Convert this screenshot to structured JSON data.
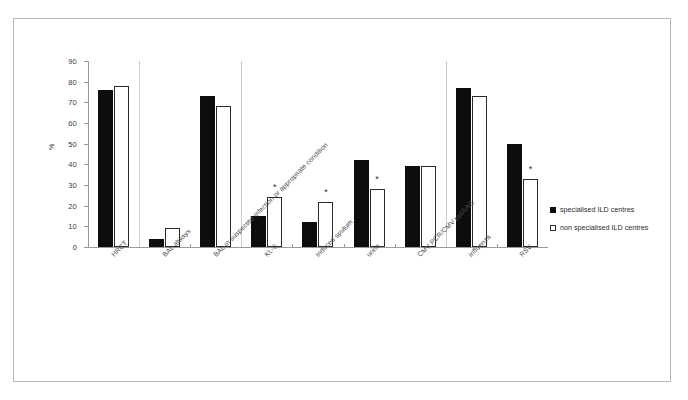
{
  "chart_data": {
    "type": "bar",
    "title": "",
    "xlabel": "",
    "ylabel": "%",
    "ylim": [
      0,
      90
    ],
    "yticks": [
      0,
      10,
      20,
      30,
      40,
      50,
      60,
      70,
      80,
      90
    ],
    "grid": false,
    "legend_position": "right",
    "categories": [
      "HRCT",
      "BAL always",
      "BAL in suspected infection or appropriate condition",
      "KL-6",
      "induced sputum",
      "urine",
      "CMV PCR/CMV pp65AG",
      "influenza",
      "RSV"
    ],
    "series": [
      {
        "name": "specialised ILD centres",
        "color": "#0d0d0d",
        "values": [
          76,
          4,
          73,
          15,
          12,
          42,
          39,
          77,
          50
        ]
      },
      {
        "name": "non specialised ILD centres",
        "color": "#ffffff",
        "values": [
          78,
          9,
          68,
          24,
          22,
          28,
          39,
          73,
          33
        ]
      }
    ],
    "annotations": {
      "symbol": "*",
      "significant_categories": [
        "KL-6",
        "induced sputum",
        "urine",
        "RSV"
      ]
    }
  },
  "legend": {
    "entries": [
      {
        "label": "specialised ILD centres",
        "swatch": "dark"
      },
      {
        "label": "non specialised ILD centres",
        "swatch": "light"
      }
    ]
  }
}
